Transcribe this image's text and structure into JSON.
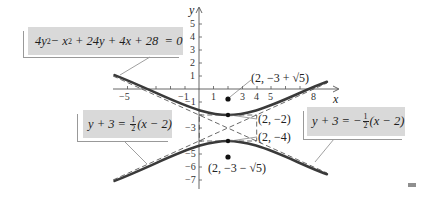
{
  "diagram": {
    "title_equation": "4y² − x² + 24y + 4x + 28 = 0",
    "equation_parts": {
      "a": "4y",
      "a_sup": "2",
      "b": " − x",
      "b_sup": "2",
      "rest": " + 24y + 4x + 28  = 0"
    },
    "asymptote_left": {
      "lhs": "y + 3 = ",
      "num": "1",
      "den": "2",
      "rhs": "(x − 2)"
    },
    "asymptote_right": {
      "lhs": "y + 3 = −",
      "num": "1",
      "den": "2",
      "rhs": "(x − 2)"
    },
    "axes": {
      "x_label": "x",
      "y_label": "y",
      "x_ticks": [
        "−5",
        "−1",
        "1",
        "3",
        "4",
        "5",
        "8"
      ],
      "y_ticks": [
        "5",
        "4",
        "3",
        "2",
        "1",
        "−1",
        "−3",
        "−5",
        "−6",
        "−7"
      ]
    },
    "points": {
      "focus_upper": "(2, −3 + √5)",
      "focus_lower": "(2, −3 − √5)",
      "vertex_upper": "(2, −2)",
      "vertex_lower": "(2, −4)"
    },
    "colors": {
      "curve": "#3a3a3a",
      "label_box": "#d9d9d9",
      "axis": "#555555"
    }
  }
}
